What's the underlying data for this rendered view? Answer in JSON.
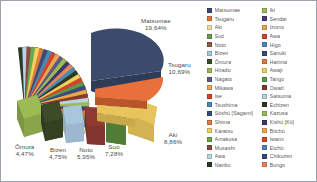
{
  "chart_data": {
    "type": "pie",
    "title": "",
    "exploded": true,
    "three_d": true,
    "legend_position": "right",
    "value_format": "percent-comma",
    "categories": [
      "Matsumae",
      "Tsugaru",
      "Aki",
      "Suō",
      "Noto",
      "Bizen",
      "Ōmura",
      "Hirado",
      "Nagato",
      "Mikawa",
      "Ise",
      "Tsushima",
      "Sōshū [Sagami]",
      "Shima",
      "Karatsu",
      "Amakusa",
      "Musashi",
      "Awa",
      "Nanbu",
      "Iki",
      "Sendai",
      "Izumo",
      "Awa",
      "Higo",
      "Sanuki",
      "Harima",
      "Awaji",
      "Tango",
      "Owari",
      "Satsuma",
      "Echizen",
      "Kazusa",
      "Kishū [Kii]",
      "Bitchū",
      "Iwami",
      "Etchū",
      "Chikuzen",
      "Bungo"
    ],
    "values": [
      19.64,
      10.69,
      8.86,
      7.28,
      5.95,
      4.75,
      4.47,
      3.6,
      3.2,
      2.9,
      2.6,
      2.3,
      2.1,
      1.9,
      1.7,
      1.5,
      1.35,
      1.2,
      1.1,
      1.0,
      0.95,
      0.9,
      0.85,
      0.8,
      0.75,
      0.7,
      0.65,
      0.6,
      0.55,
      0.5,
      0.48,
      0.45,
      0.42,
      0.4,
      0.38,
      0.35,
      0.32,
      0.3
    ],
    "labeled_slices": [
      {
        "name": "Matsumae",
        "percent": "19,64%",
        "color": "#3c4a6b"
      },
      {
        "name": "Tsugaru",
        "percent": "10,69%",
        "color": "#e8703a"
      },
      {
        "name": "Aki",
        "percent": "8,86%",
        "color": "#e8c55c"
      },
      {
        "name": "Suō",
        "percent": "7,28%",
        "color": "#5a8a3c"
      },
      {
        "name": "Noto",
        "percent": "5,95%",
        "color": "#8f3b33"
      },
      {
        "name": "Bizen",
        "percent": "4,75%",
        "color": "#a8c6dd"
      },
      {
        "name": "Ōmura",
        "percent": "4,47%",
        "color": "#9cbb54"
      }
    ]
  },
  "legend": {
    "column_left": [
      {
        "label": "Matsumae",
        "color": "#3c4a6b"
      },
      {
        "label": "Tsugaru",
        "color": "#e8703a"
      },
      {
        "label": "Aki",
        "color": "#f0dca0"
      },
      {
        "label": "Suō",
        "color": "#6f9a4e"
      },
      {
        "label": "Noto",
        "color": "#8f5a3c"
      },
      {
        "label": "Bizen",
        "color": "#a8c6dd"
      },
      {
        "label": "Ōmura",
        "color": "#3c4a28"
      },
      {
        "label": "Hirado",
        "color": "#9cbb54"
      },
      {
        "label": "Nagato",
        "color": "#5a5a8a"
      },
      {
        "label": "Mikawa",
        "color": "#e8a84a"
      },
      {
        "label": "Ise",
        "color": "#d4442c"
      },
      {
        "label": "Tsushima",
        "color": "#4a8ab0"
      },
      {
        "label": "Sōshū [Sagami]",
        "color": "#3a4a7a"
      },
      {
        "label": "Shima",
        "color": "#e07a3a"
      },
      {
        "label": "Karatsu",
        "color": "#f0d060"
      },
      {
        "label": "Amakusa",
        "color": "#6aa84a"
      },
      {
        "label": "Musashi",
        "color": "#8a4a3c"
      },
      {
        "label": "Awa",
        "color": "#b8d4e4"
      },
      {
        "label": "Nanbu",
        "color": "#2c3a22"
      }
    ],
    "column_right": [
      {
        "label": "Iki",
        "color": "#9cbb54"
      },
      {
        "label": "Sendai",
        "color": "#4a3a7a"
      },
      {
        "label": "Izumo",
        "color": "#e8a84a"
      },
      {
        "label": "Awa",
        "color": "#d4442c"
      },
      {
        "label": "Higo",
        "color": "#4a8ab0"
      },
      {
        "label": "Sanuki",
        "color": "#3a4a7a"
      },
      {
        "label": "Harima",
        "color": "#e07a3a"
      },
      {
        "label": "Awaji",
        "color": "#f0d060"
      },
      {
        "label": "Tango",
        "color": "#5a9a4a"
      },
      {
        "label": "Owari",
        "color": "#8a3a2c"
      },
      {
        "label": "Satsuma",
        "color": "#b8d4e4"
      },
      {
        "label": "Echizen",
        "color": "#2c3a22"
      },
      {
        "label": "Kazusa",
        "color": "#9cbb54"
      },
      {
        "label": "Kishū [Kii]",
        "color": "#3a3a6a"
      },
      {
        "label": "Bitchū",
        "color": "#e8a84a"
      },
      {
        "label": "Iwami",
        "color": "#d4442c"
      },
      {
        "label": "Etchū",
        "color": "#4a8ab0"
      },
      {
        "label": "Chikuzen",
        "color": "#3a4a7a"
      },
      {
        "label": "Bungo",
        "color": "#e8845a"
      }
    ]
  }
}
